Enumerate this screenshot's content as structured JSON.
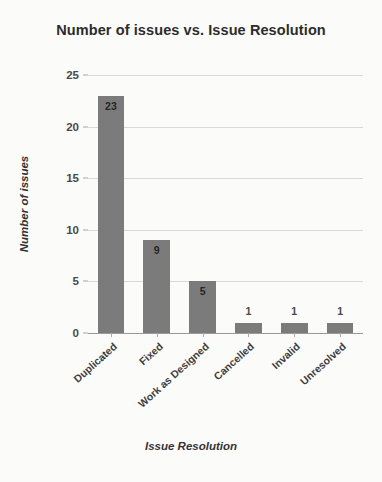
{
  "chart_data": {
    "type": "bar",
    "title": "Number of issues vs. Issue Resolution",
    "xlabel": "Issue Resolution",
    "ylabel": "Number of issues",
    "categories": [
      "Duplicated",
      "Fixed",
      "Work as Designed",
      "Cancelled",
      "Invalid",
      "Unresolved"
    ],
    "values": [
      23,
      9,
      5,
      1,
      1,
      1
    ],
    "value_labels": [
      "23",
      "9",
      "5",
      "1",
      "1",
      "1"
    ],
    "ylim": [
      0,
      25
    ],
    "y_ticks": [
      0,
      5,
      10,
      15,
      20,
      25
    ],
    "y_tick_labels": [
      "0",
      "5",
      "10",
      "15",
      "20",
      "25"
    ],
    "grid": true,
    "legend": false,
    "bar_color": "#7b7b7b",
    "background_color": "#fbfbfa",
    "gridline_color": "#d8d8d6",
    "title_color": "#2c2c2c"
  }
}
